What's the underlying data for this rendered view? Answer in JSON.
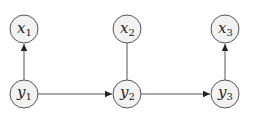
{
  "diagram": {
    "type": "graphical-model",
    "nodes": [
      {
        "id": "x1",
        "var": "x",
        "sub": "1",
        "cx": 24,
        "cy": 29
      },
      {
        "id": "x2",
        "var": "x",
        "sub": "2",
        "cx": 127,
        "cy": 29
      },
      {
        "id": "x3",
        "var": "x",
        "sub": "3",
        "cx": 225,
        "cy": 29
      },
      {
        "id": "y1",
        "var": "y",
        "sub": "1",
        "cx": 24,
        "cy": 94
      },
      {
        "id": "y2",
        "var": "y",
        "sub": "2",
        "cx": 127,
        "cy": 94
      },
      {
        "id": "y3",
        "var": "y",
        "sub": "3",
        "cx": 225,
        "cy": 94
      }
    ],
    "edges": [
      {
        "from": "y1",
        "to": "x1",
        "directed": true
      },
      {
        "from": "y2",
        "to": "x2",
        "directed": false
      },
      {
        "from": "y3",
        "to": "x3",
        "directed": true
      },
      {
        "from": "y1",
        "to": "y2",
        "directed": true
      },
      {
        "from": "y2",
        "to": "y3",
        "directed": true
      }
    ],
    "node_radius": 14,
    "colors": {
      "node_fill": "#f2f2f2",
      "stroke": "#555555",
      "text": "#222222"
    }
  }
}
